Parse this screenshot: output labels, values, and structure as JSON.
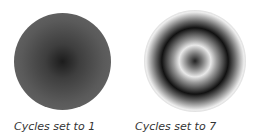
{
  "figures": [
    {
      "caption": "Cycles set to 1",
      "cycles": 1
    },
    {
      "caption": "Cycles set to 7",
      "cycles": 7
    }
  ]
}
